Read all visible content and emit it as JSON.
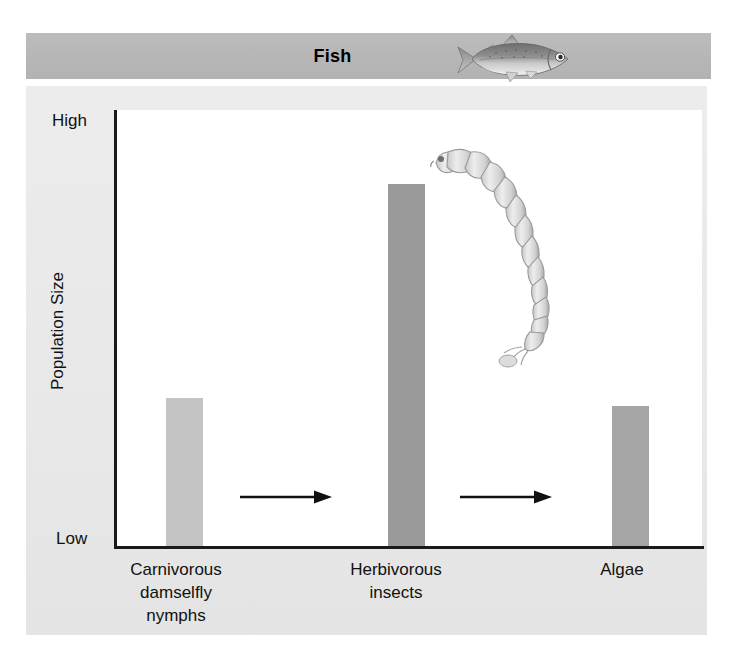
{
  "figure": {
    "header": {
      "title": "Fish",
      "icon": "fish-illustration",
      "band_color": "#b9b9b9"
    },
    "panel_color": "#e9e9e9",
    "plot_background": "#ffffff",
    "axis_color": "#1a1a1a",
    "larva_icon": "midge-larva-illustration"
  },
  "chart_data": {
    "type": "bar",
    "title": "Fish",
    "xlabel": "",
    "ylabel": "Population Size",
    "categories": [
      "Carnivorous\ndamselfly\nnymphs",
      "Herbivorous\ninsects",
      "Algae"
    ],
    "category_labels_flat": [
      "Carnivorous damselfly nymphs",
      "Herbivorous insects",
      "Algae"
    ],
    "values": [
      34,
      83,
      32
    ],
    "ylim": [
      0,
      100
    ],
    "ytick_labels": [
      "Low",
      "High"
    ],
    "ytick_values": [
      0,
      100
    ],
    "grid": false,
    "legend": null,
    "bar_colors": [
      "#c4c4c4",
      "#9a9a9a",
      "#a5a5a5"
    ],
    "bars": [
      {
        "label": "Carnivorous damselfly nymphs",
        "value": 34,
        "color": "#c4c4c4"
      },
      {
        "label": "Herbivorous insects",
        "value": 83,
        "color": "#9a9a9a"
      },
      {
        "label": "Algae",
        "value": 32,
        "color": "#a5a5a5"
      }
    ],
    "annotations": [
      {
        "type": "arrow",
        "direction": "right",
        "from": "Carnivorous damselfly nymphs",
        "to": "Herbivorous insects"
      },
      {
        "type": "arrow",
        "direction": "right",
        "from": "Herbivorous insects",
        "to": "Algae"
      },
      {
        "type": "image",
        "name": "midge-larva-illustration"
      },
      {
        "type": "image",
        "name": "fish-illustration"
      }
    ]
  }
}
